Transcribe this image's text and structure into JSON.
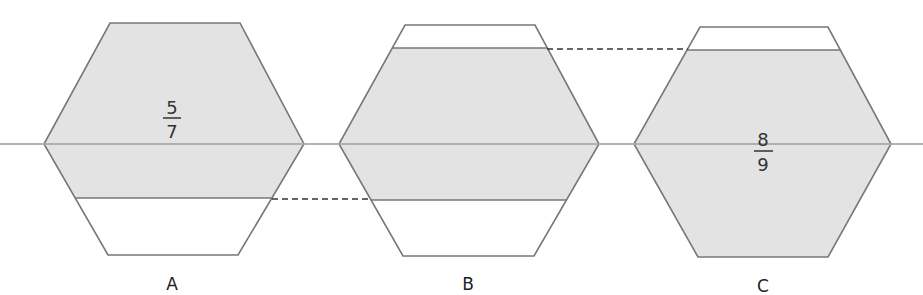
{
  "colors": {
    "shade": "#e3e3e3",
    "outline": "#777777",
    "midline": "#a8a8a8",
    "dash": "#333333"
  },
  "hexagons": [
    {
      "label": "A",
      "fraction": {
        "numerator": "5",
        "denominator": "7"
      },
      "shaded_part": "lower boundary line, top shaded"
    },
    {
      "label": "B",
      "fraction": null,
      "shaded_part": "middle band shaded"
    },
    {
      "label": "C",
      "fraction": {
        "numerator": "8",
        "denominator": "9"
      },
      "shaded_part": "top strip unshaded"
    }
  ]
}
